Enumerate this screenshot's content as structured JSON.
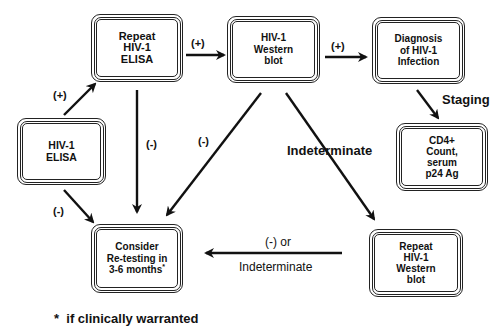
{
  "boxes": {
    "elisa": {
      "lines": [
        "HIV-1",
        "ELISA"
      ]
    },
    "repeat_elisa": {
      "lines": [
        "Repeat",
        "HIV-1",
        "ELISA"
      ]
    },
    "western_blot": {
      "lines": [
        "HIV-1",
        "Western",
        "blot"
      ]
    },
    "diagnosis": {
      "lines": [
        "Diagnosis",
        "of HIV-1",
        "Infection"
      ]
    },
    "cd4": {
      "lines": [
        "CD4+",
        "Count,",
        "serum",
        "p24 Ag"
      ]
    },
    "retest": {
      "lines": [
        "Consider",
        "Re-testing in",
        "3-6 months"
      ],
      "footnote_mark": "*"
    },
    "repeat_western": {
      "lines": [
        "Repeat",
        "HIV-1",
        "Western",
        "blot"
      ]
    }
  },
  "edge_labels": {
    "elisa_to_repeat": "(+)",
    "elisa_to_retest": "(-)",
    "repeat_to_western": "(+)",
    "repeat_to_retest": "(-)",
    "western_to_retest": "(-)",
    "western_to_diagnosis": "(+)",
    "diagnosis_to_cd4": "Staging",
    "western_to_repeat_western": "Indeterminate",
    "repeat_western_to_retest_top": "(-) or",
    "repeat_western_to_retest_bottom": "Indeterminate"
  },
  "footnote": "*  if clinically warranted"
}
